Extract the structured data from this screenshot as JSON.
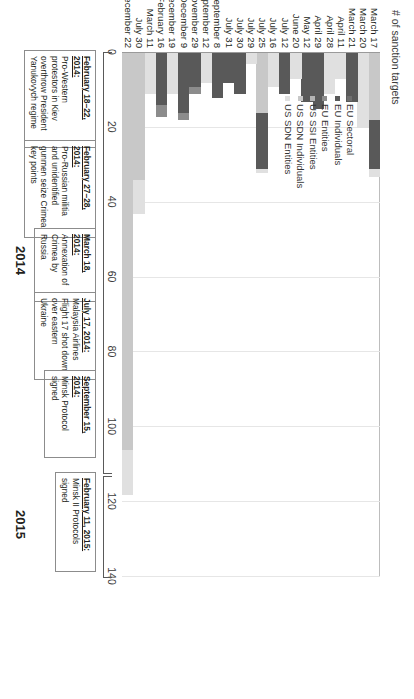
{
  "chart_data": {
    "type": "bar",
    "orientation": "vertical-stacked",
    "title": "",
    "ylabel": "# of sanction targets",
    "xlabel": "",
    "ylim": [
      0,
      140
    ],
    "yticks": [
      0,
      20,
      40,
      60,
      80,
      100,
      120,
      140
    ],
    "grid": true,
    "legend_position": "upper-left-inside",
    "categories": [
      "March 17",
      "March 20",
      "March 21",
      "April 11",
      "April 28",
      "April 29",
      "May 12",
      "June 20",
      "July 12",
      "July 16",
      "July 25",
      "July 29",
      "July 30",
      "July 31",
      "September 8",
      "September 12",
      "November 29",
      "December 9",
      "December 19",
      "February 16",
      "March 11",
      "July 30",
      "December 22"
    ],
    "series": [
      {
        "name": "EU Sectoral",
        "color": "#6e6e6e",
        "values": [
          0,
          0,
          0,
          0,
          0,
          0,
          0,
          0,
          0,
          0,
          0,
          0,
          0,
          0,
          0,
          0,
          0,
          0,
          0,
          0,
          0,
          0,
          0
        ]
      },
      {
        "name": "EU Individuals",
        "color": "#595959",
        "values": [
          13,
          0,
          13,
          0,
          0,
          15,
          13,
          0,
          11,
          0,
          15,
          0,
          11,
          8,
          12,
          0,
          9,
          16,
          0,
          14,
          0,
          0,
          0
        ]
      },
      {
        "name": "EU Entities",
        "color": "#8c8c8c",
        "values": [
          0,
          0,
          0,
          0,
          0,
          0,
          0,
          0,
          0,
          0,
          0,
          0,
          0,
          0,
          0,
          0,
          2,
          2,
          0,
          3,
          0,
          0,
          0
        ]
      },
      {
        "name": "US SSI Entities",
        "color": "#b3b3b3",
        "values": [
          0,
          0,
          0,
          0,
          0,
          0,
          0,
          0,
          0,
          0,
          0,
          0,
          0,
          0,
          0,
          0,
          0,
          0,
          0,
          0,
          0,
          0,
          0
        ]
      },
      {
        "name": "US SDN Individuals",
        "color": "#c8c8c8",
        "values": [
          18,
          0,
          0,
          0,
          0,
          0,
          0,
          0,
          0,
          0,
          16,
          0,
          0,
          0,
          0,
          0,
          0,
          0,
          0,
          0,
          0,
          34,
          106
        ]
      },
      {
        "name": "US SDN Entities",
        "color": "#e0e0e0",
        "values": [
          2,
          20,
          0,
          7,
          11,
          0,
          0,
          7,
          0,
          9,
          1,
          3,
          0,
          0,
          0,
          8,
          0,
          0,
          11,
          0,
          11,
          9,
          12
        ]
      }
    ],
    "totals": [
      33,
      20,
      13,
      7,
      11,
      15,
      13,
      7,
      11,
      9,
      32,
      3,
      11,
      8,
      12,
      8,
      11,
      18,
      11,
      17,
      11,
      43,
      118
    ],
    "bar_layout": [
      {
        "category": "March 17",
        "segments": [
          {
            "series": "US SDN Individuals",
            "value": 18
          },
          {
            "series": "EU Individuals",
            "value": 13
          },
          {
            "series": "US SDN Entities",
            "value": 2
          }
        ]
      },
      {
        "category": "March 20",
        "segments": [
          {
            "series": "US SDN Entities",
            "value": 20
          }
        ]
      },
      {
        "category": "March 21",
        "segments": [
          {
            "series": "EU Individuals",
            "value": 13
          }
        ]
      },
      {
        "category": "April 11",
        "segments": [
          {
            "series": "US SDN Entities",
            "value": 7
          }
        ]
      },
      {
        "category": "April 28",
        "segments": [
          {
            "series": "US SDN Entities",
            "value": 11
          }
        ]
      },
      {
        "category": "April 29",
        "segments": [
          {
            "series": "EU Individuals",
            "value": 15
          }
        ]
      },
      {
        "category": "May 12",
        "segments": [
          {
            "series": "EU Individuals",
            "value": 13
          }
        ]
      },
      {
        "category": "June 20",
        "segments": [
          {
            "series": "US SDN Entities",
            "value": 7
          }
        ]
      },
      {
        "category": "July 12",
        "segments": [
          {
            "series": "EU Individuals",
            "value": 11
          }
        ]
      },
      {
        "category": "July 16",
        "segments": [
          {
            "series": "US SDN Entities",
            "value": 9
          }
        ]
      },
      {
        "category": "July 25",
        "segments": [
          {
            "series": "US SDN Individuals",
            "value": 16
          },
          {
            "series": "EU Individuals",
            "value": 15
          },
          {
            "series": "US SDN Entities",
            "value": 1
          }
        ]
      },
      {
        "category": "July 29",
        "segments": [
          {
            "series": "US SDN Entities",
            "value": 3
          }
        ]
      },
      {
        "category": "July 30",
        "segments": [
          {
            "series": "EU Individuals",
            "value": 11
          }
        ]
      },
      {
        "category": "July 31",
        "segments": [
          {
            "series": "EU Individuals",
            "value": 8
          }
        ]
      },
      {
        "category": "September 8",
        "segments": [
          {
            "series": "EU Individuals",
            "value": 12
          }
        ]
      },
      {
        "category": "September 12",
        "segments": [
          {
            "series": "US SDN Entities",
            "value": 8
          }
        ]
      },
      {
        "category": "November 29",
        "segments": [
          {
            "series": "EU Individuals",
            "value": 9
          },
          {
            "series": "EU Entities",
            "value": 2
          }
        ]
      },
      {
        "category": "December 9",
        "segments": [
          {
            "series": "EU Individuals",
            "value": 16
          },
          {
            "series": "EU Entities",
            "value": 2
          }
        ]
      },
      {
        "category": "December 19",
        "segments": [
          {
            "series": "US SDN Entities",
            "value": 11
          }
        ]
      },
      {
        "category": "February 16",
        "segments": [
          {
            "series": "EU Individuals",
            "value": 14
          },
          {
            "series": "EU Entities",
            "value": 3
          }
        ]
      },
      {
        "category": "March 11",
        "segments": [
          {
            "series": "US SDN Entities",
            "value": 11
          }
        ]
      },
      {
        "category": "July 30",
        "segments": [
          {
            "series": "US SDN Individuals",
            "value": 34
          },
          {
            "series": "US SDN Entities",
            "value": 9
          }
        ]
      },
      {
        "category": "December 22",
        "segments": [
          {
            "series": "US SDN Individuals",
            "value": 106
          },
          {
            "series": "US SDN Entities",
            "value": 12
          }
        ]
      }
    ],
    "annotations": [
      {
        "date": "February 18–22, 2014:",
        "text": "Pro-Western protestors in Kiev overthrow President Yanukovych regime"
      },
      {
        "date": "February 27–28, 2014:",
        "text": "Pro-Russian militia and unidentified gunmen seize Crimea key points"
      },
      {
        "date": "March 18, 2014:",
        "text": "Annexation of Crimea by Russia"
      },
      {
        "date": "July 17, 2014:",
        "text": "Malaysia Airlines Flight 17 shot down over eastern Ukraine"
      },
      {
        "date": "September 15, 2014:",
        "text": "Minsk Protocol signed"
      },
      {
        "date": "February 11, 2015:",
        "text": "Minsk II Protocols signed"
      }
    ],
    "year_groups": [
      {
        "label": "2014"
      },
      {
        "label": "2015"
      }
    ]
  },
  "axis": {
    "y_title": "# of sanction targets",
    "ticks": [
      "0",
      "20",
      "40",
      "60",
      "80",
      "100",
      "120",
      "140"
    ]
  },
  "legend": {
    "items": [
      {
        "label": "EU Sectoral",
        "color": "#6e6e6e"
      },
      {
        "label": "EU Individuals",
        "color": "#595959"
      },
      {
        "label": "EU Entities",
        "color": "#8c8c8c"
      },
      {
        "label": "US SSI Entities",
        "color": "#b3b3b3"
      },
      {
        "label": "US SDN Individuals",
        "color": "#c8c8c8"
      },
      {
        "label": "US SDN Entities",
        "color": "#e0e0e0"
      }
    ]
  },
  "years": {
    "y2014": "2014",
    "y2015": "2015"
  }
}
